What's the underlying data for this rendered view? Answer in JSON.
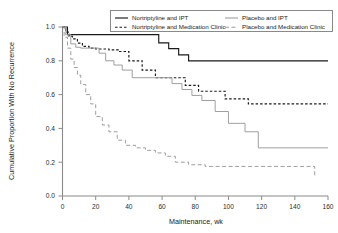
{
  "chart_data": {
    "type": "line",
    "title": "",
    "subtitle": "",
    "xlabel": "Maintenance, wk",
    "ylabel": "Cumulative Proportion With No Recurrence",
    "xlim": [
      0,
      160
    ],
    "ylim": [
      0.0,
      1.0
    ],
    "xticks": [
      0,
      20,
      40,
      60,
      80,
      100,
      120,
      140,
      160
    ],
    "xtick_labels": [
      "0",
      "20",
      "40",
      "60",
      "80",
      "100",
      "120",
      "140",
      "160"
    ],
    "yticks": [
      0.0,
      0.2,
      0.4,
      0.6,
      0.8,
      1.0
    ],
    "ytick_labels": [
      "0.0",
      "0.2",
      "0.4",
      "0.6",
      "0.8",
      "1.0"
    ],
    "grid": false,
    "legend_position": "top-right-inside",
    "step_type": "post",
    "series": [
      {
        "name": "Nortriptyline and IPT",
        "color": "#1a1a1a",
        "dash": "none",
        "legend_column": 0,
        "x": [
          0,
          3,
          52,
          58,
          64,
          70,
          76,
          160
        ],
        "y": [
          1.0,
          0.955,
          0.955,
          0.906,
          0.872,
          0.835,
          0.8,
          0.8
        ]
      },
      {
        "name": "Nortriptyline and Medication Clinic",
        "color": "#1a1a1a",
        "dash": "2.5,2",
        "legend_column": 0,
        "x": [
          0,
          2,
          4,
          6,
          9,
          12,
          16,
          20,
          24,
          28,
          34,
          40,
          48,
          56,
          62,
          68,
          74,
          82,
          90,
          98,
          112,
          160
        ],
        "y": [
          1.0,
          0.97,
          0.945,
          0.93,
          0.905,
          0.885,
          0.875,
          0.87,
          0.87,
          0.865,
          0.855,
          0.8,
          0.745,
          0.7,
          0.7,
          0.7,
          0.655,
          0.62,
          0.62,
          0.575,
          0.545,
          0.545
        ]
      },
      {
        "name": "Placebo and IPT",
        "color": "#9a9a9a",
        "dash": "none",
        "legend_column": 1,
        "x": [
          0,
          2,
          5,
          8,
          11,
          14,
          18,
          22,
          26,
          31,
          36,
          42,
          48,
          54,
          60,
          66,
          72,
          78,
          84,
          92,
          100,
          110,
          118,
          160
        ],
        "y": [
          1.0,
          0.955,
          0.9,
          0.88,
          0.875,
          0.875,
          0.875,
          0.845,
          0.8,
          0.775,
          0.745,
          0.7,
          0.7,
          0.7,
          0.7,
          0.665,
          0.63,
          0.595,
          0.565,
          0.5,
          0.43,
          0.38,
          0.285,
          0.285
        ]
      },
      {
        "name": "Placebo and Medication Clinic",
        "color": "#9a9a9a",
        "dash": "4,2.5",
        "legend_column": 1,
        "x": [
          0,
          1,
          3,
          5,
          7,
          9,
          11,
          14,
          17,
          20,
          24,
          28,
          33,
          38,
          44,
          50,
          56,
          62,
          68,
          76,
          86,
          96,
          110,
          130,
          146,
          152
        ],
        "y": [
          1.0,
          0.94,
          0.875,
          0.81,
          0.76,
          0.715,
          0.66,
          0.6,
          0.545,
          0.47,
          0.42,
          0.38,
          0.33,
          0.3,
          0.285,
          0.27,
          0.255,
          0.235,
          0.2,
          0.185,
          0.175,
          0.175,
          0.175,
          0.175,
          0.175,
          0.12
        ]
      }
    ],
    "legend_entries": [
      {
        "label": "Nortriptyline and IPT",
        "color": "#1a1a1a",
        "dash": "none"
      },
      {
        "label": "Nortriptyline and Medication Clinic",
        "color": "#1a1a1a",
        "dash": "2.5,2"
      },
      {
        "label": "Placebo and IPT",
        "color": "#9a9a9a",
        "dash": "none"
      },
      {
        "label": "Placebo and Medication Clinic",
        "color": "#9a9a9a",
        "dash": "4,2.5"
      }
    ]
  }
}
